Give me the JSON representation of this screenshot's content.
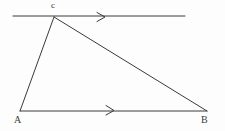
{
  "figure": {
    "background_color": "#fdfdfd",
    "stroke_color": "#3a3a3a",
    "vertices": [
      {
        "id": "A",
        "label": "A",
        "x": 20,
        "y": 111
      },
      {
        "id": "B",
        "label": "B",
        "x": 207,
        "y": 111
      },
      {
        "id": "C",
        "label": "c",
        "x": 54,
        "y": 17
      }
    ],
    "segments": [
      {
        "name": "side-AC",
        "from": "A",
        "to": "C",
        "x1": 20,
        "y1": 111,
        "x2": 54,
        "y2": 17
      },
      {
        "name": "side-CB",
        "from": "C",
        "to": "B",
        "x1": 54,
        "y1": 17,
        "x2": 207,
        "y2": 111
      },
      {
        "name": "side-AB",
        "from": "A",
        "to": "B",
        "x1": 20,
        "y1": 111,
        "x2": 207,
        "y2": 111
      }
    ],
    "lines": [
      {
        "name": "top-parallel-line",
        "x1": 13,
        "y1": 16,
        "x2": 185,
        "y2": 16
      }
    ],
    "arrow_marks": [
      {
        "name": "arrow-top-line",
        "x": 104,
        "y": 17,
        "direction": "right"
      },
      {
        "name": "arrow-base-line",
        "x": 113,
        "y": 110,
        "direction": "right"
      }
    ]
  }
}
